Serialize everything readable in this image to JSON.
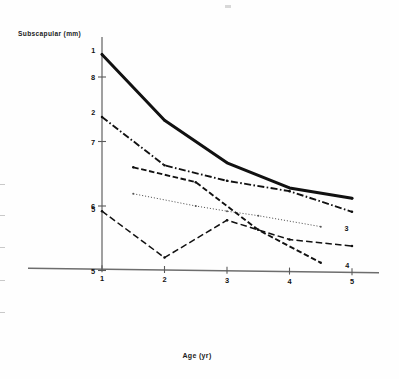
{
  "figure": {
    "background": "#fefefe",
    "ink": "#111111"
  },
  "chart_data": {
    "type": "line",
    "title": "",
    "xlabel": "Age (yr)",
    "ylabel": "Subscapular (mm)",
    "xlim": [
      0.3,
      5.6
    ],
    "ylim": [
      4.15,
      8.75
    ],
    "xticks": [
      1,
      2,
      3,
      4,
      5
    ],
    "xtick_labels": [
      "1",
      "2",
      "3",
      "4",
      "5"
    ],
    "yticks": [
      5,
      6,
      7,
      8
    ],
    "ytick_labels": [
      "5",
      "6",
      "7",
      "8"
    ],
    "grid": false,
    "legend": "inline-endpoint-labels",
    "series": [
      {
        "name": "1",
        "label": "1",
        "style": "solid-thick",
        "color": "#111111",
        "x": [
          1,
          2,
          3,
          4,
          5
        ],
        "values": [
          8.35,
          7.33,
          6.67,
          6.28,
          6.12
        ],
        "label_position": {
          "x": 0.86,
          "y": 8.42
        },
        "end_label_position": {
          "x": 5.0,
          "y": 6.12
        }
      },
      {
        "name": "2",
        "label": "2",
        "style": "dash-dot",
        "color": "#111111",
        "x": [
          1,
          2,
          3,
          4,
          5
        ],
        "values": [
          7.38,
          6.63,
          6.39,
          6.23,
          5.91
        ],
        "label_position": {
          "x": 0.86,
          "y": 7.45
        },
        "end_label_position": {
          "x": 5.0,
          "y": 5.91
        }
      },
      {
        "name": "3",
        "label": "3",
        "style": "dotted-fine",
        "color": "#555555",
        "x": [
          1.5,
          2.5,
          3.0,
          3.5,
          4.5
        ],
        "values": [
          6.19,
          6.0,
          5.92,
          5.85,
          5.68
        ],
        "end_label_position": {
          "x": 4.72,
          "y": 5.66
        }
      },
      {
        "name": "4",
        "label": "4",
        "style": "dashed",
        "color": "#111111",
        "x": [
          1.5,
          2.5,
          3.5,
          4.5
        ],
        "values": [
          6.6,
          6.37,
          5.63,
          5.12
        ],
        "end_label_position": {
          "x": 4.73,
          "y": 5.09
        }
      },
      {
        "name": "5",
        "label": "5",
        "style": "long-dash",
        "color": "#111111",
        "x": [
          1,
          2,
          3,
          4,
          5
        ],
        "values": [
          5.92,
          5.2,
          5.78,
          5.48,
          5.38
        ],
        "label_position": {
          "x": 0.86,
          "y": 5.95
        },
        "end_label_position": {
          "x": 5.0,
          "y": 5.38
        }
      }
    ]
  }
}
